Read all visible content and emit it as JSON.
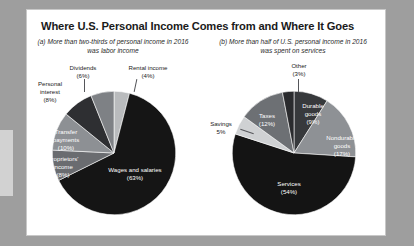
{
  "figure": {
    "title": "Where U.S. Personal Income Comes from and Where It Goes",
    "background_color": "#9e9e9e",
    "card_color": "#ffffff"
  },
  "panels": [
    {
      "id": "a",
      "caption": "(a) More than two-thirds of personal income in 2016 was labor income"
    },
    {
      "id": "b",
      "caption": "(b) More than half of U.S. personal income in 2016 was spent on services"
    }
  ],
  "chart_data": [
    {
      "type": "pie",
      "id": "personal-income-sources",
      "title": "(a) More than two-thirds of personal income in 2016 was labor income",
      "categories": [
        "Rental income",
        "Wages and salaries",
        "Proprietors' income",
        "Transfer payments",
        "Personal interest",
        "Dividends"
      ],
      "values": [
        4,
        63,
        8,
        10,
        8,
        6
      ],
      "labels": [
        "Rental income (4%)",
        "Wages and salaries (63%)",
        "Proprietors' income (8%)",
        "Transfer payments (10%)",
        "Personal interest (8%)",
        "Dividends (6%)"
      ],
      "colors": [
        "#b9bbbd",
        "#151515",
        "#6a6c70",
        "#8d9094",
        "#2e2f32",
        "#7e8185"
      ],
      "label_placement": [
        "outside",
        "inside",
        "inside",
        "inside",
        "outside",
        "outside"
      ],
      "units": "percent",
      "legend": "none"
    },
    {
      "type": "pie",
      "id": "personal-income-uses",
      "title": "(b) More than half of U.S. personal income in 2016 was spent on services",
      "categories": [
        "Durable goods",
        "Nondurable goods",
        "Services",
        "Savings",
        "Taxes",
        "Other"
      ],
      "values": [
        9,
        17,
        54,
        5,
        12,
        3
      ],
      "labels": [
        "Durable goods (9%)",
        "Nondurable goods (17%)",
        "Services (54%)",
        "Savings 5%",
        "Taxes (12%)",
        "Other (3%)"
      ],
      "colors": [
        "#37393c",
        "#8e9195",
        "#141414",
        "#cfd1d3",
        "#6d7074",
        "#2a2b2e"
      ],
      "label_placement": [
        "inside",
        "inside",
        "inside",
        "outside",
        "inside",
        "outside"
      ],
      "units": "percent",
      "legend": "none"
    }
  ],
  "pie_a_labels": {
    "dividends": "Dividends\n(6%)",
    "dividends_line1": "Dividends",
    "dividends_line2": "(6%)",
    "rental_line1": "Rental income",
    "rental_line2": "(4%)",
    "personal_interest_line1": "Personal",
    "personal_interest_line2": "interest",
    "personal_interest_line3": "(8%)",
    "transfer_line1": "Transfer",
    "transfer_line2": "payments",
    "transfer_line3": "(10%)",
    "proprietors_line1": "Proprietors'",
    "proprietors_line2": "income",
    "proprietors_line3": "(8%)",
    "wages_line1": "Wages and salaries",
    "wages_line2": "(63%)"
  },
  "pie_b_labels": {
    "other_line1": "Other",
    "other_line2": "(3%)",
    "durable_line1": "Durable",
    "durable_line2": "goods",
    "durable_line3": "(9%)",
    "nondurable_line1": "Nondurable",
    "nondurable_line2": "goods",
    "nondurable_line3": "(17%)",
    "taxes_line1": "Taxes",
    "taxes_line2": "(12%)",
    "savings_line1": "Savings",
    "savings_line2": "5%",
    "services_line1": "Services",
    "services_line2": "(54%)"
  }
}
